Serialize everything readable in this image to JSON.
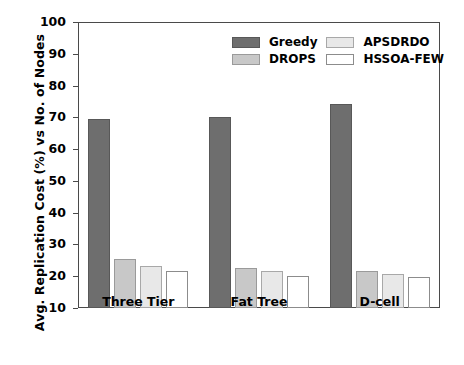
{
  "chart_data": {
    "type": "bar",
    "title": "",
    "xlabel": "",
    "ylabel": "Avg. Replication Cost (%) vs No. of Nodes",
    "categories": [
      "Three Tier",
      "Fat Tree",
      "D-cell"
    ],
    "ylim": [
      10,
      100
    ],
    "yticks": [
      10,
      20,
      30,
      40,
      50,
      60,
      70,
      80,
      90,
      100
    ],
    "grid": false,
    "legend_position": "upper center",
    "series": [
      {
        "name": "Greedy",
        "color": "#6e6e6e",
        "edge": "#585858",
        "values": [
          69.5,
          70.2,
          74.3
        ]
      },
      {
        "name": "DROPS",
        "color": "#c8c8c8",
        "edge": "#9a9a9a",
        "values": [
          25.3,
          22.6,
          21.6
        ]
      },
      {
        "name": "APSDRDO",
        "color": "#e8e8e8",
        "edge": "#a8a8a8",
        "values": [
          23.3,
          21.5,
          20.7
        ]
      },
      {
        "name": "HSSOA-FEW",
        "color": "#ffffff",
        "edge": "#8c8c8c",
        "values": [
          21.7,
          20.1,
          19.6
        ]
      }
    ]
  },
  "axis": {
    "ytick_labels": [
      "100",
      "90",
      "80",
      "70",
      "60",
      "50",
      "40",
      "30",
      "20",
      "10"
    ],
    "ylabel_text": "Avg. Replication Cost (%) vs No. of Nodes",
    "xtick_labels": [
      "Three Tier",
      "Fat Tree",
      "D-cell"
    ]
  },
  "legend": {
    "entries": [
      {
        "label": "Greedy"
      },
      {
        "label": "APSDRDO"
      },
      {
        "label": "DROPS"
      },
      {
        "label": "HSSOA-FEW"
      }
    ]
  }
}
